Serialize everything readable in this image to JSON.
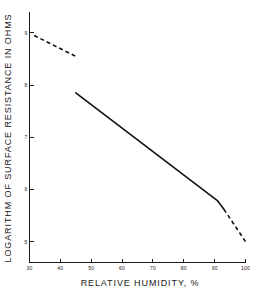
{
  "chart_data": {
    "type": "line",
    "title": "",
    "xlabel": "RELATIVE HUMIDITY, %",
    "ylabel": "LOGARITHM OF SURFACE RESISTANCE IN OHMS",
    "xlim": [
      30,
      100
    ],
    "ylim": [
      4.6,
      9.4
    ],
    "xticks": [
      30,
      40,
      50,
      60,
      70,
      80,
      90,
      100
    ],
    "yticks": [
      9,
      8,
      7,
      6,
      5
    ],
    "xtick_labels": [
      "30",
      "40",
      "50",
      "60",
      "70",
      "80",
      "90",
      "100"
    ],
    "ytick_labels": [
      "9",
      "8",
      "7",
      "6",
      "5"
    ],
    "grid": false,
    "legend": "none",
    "line_color": "#111111",
    "series": [
      {
        "name": "extrapolated-low-humidity",
        "style": "dashed",
        "x": [
          31.5,
          45.0
        ],
        "values": [
          8.95,
          8.55
        ]
      },
      {
        "name": "measured-surface-resistance",
        "style": "solid",
        "x": [
          45.0,
          91.0,
          93.0
        ],
        "values": [
          7.85,
          5.78,
          5.62
        ]
      },
      {
        "name": "extrapolated-high-humidity",
        "style": "dashed",
        "x": [
          93.0,
          100.0
        ],
        "values": [
          5.62,
          5.0
        ]
      }
    ]
  },
  "axis": {
    "x_title": "RELATIVE HUMIDITY, %",
    "y_title": "LOGARITHM OF SURFACE RESISTANCE IN OHMS"
  }
}
